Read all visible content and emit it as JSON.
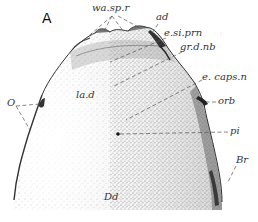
{
  "figure": {
    "panel_label": "A",
    "labels": {
      "wa_sp_r": "wa.sp.r",
      "ad": "ad",
      "e_si_prn": "e.si.prn",
      "gr_d_nb": "gr.d.nb",
      "la_d": "la.d",
      "e_caps_n": "e. caps.n",
      "orb": "orb",
      "o": "O",
      "pi": "pi",
      "br": "Br",
      "dd": "Dd"
    },
    "colors": {
      "ink": "#333333",
      "stipple_dark": "#555555",
      "stipple_light": "#bbbbbb",
      "background": "#ffffff"
    }
  }
}
